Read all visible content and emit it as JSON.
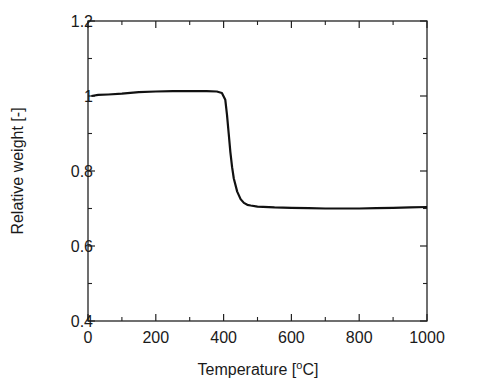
{
  "chart_data": {
    "type": "line",
    "title": "",
    "xlabel": "Temperature [oC]",
    "xlabel_parts": {
      "before": "Temperature [",
      "sup": "o",
      "after": "C]"
    },
    "ylabel": "Relative weight [-]",
    "xlim": [
      0,
      1000
    ],
    "ylim": [
      0.4,
      1.2
    ],
    "x_ticks": [
      0,
      200,
      400,
      600,
      800,
      1000
    ],
    "x_tick_labels": [
      "0",
      "200",
      "400",
      "600",
      "800",
      "1000"
    ],
    "y_ticks": [
      0.4,
      0.6,
      0.8,
      1.0,
      1.2
    ],
    "y_tick_labels": [
      "0.4",
      "0.6",
      "0.8",
      "1",
      "1.2"
    ],
    "grid": false,
    "legend": null,
    "series": [
      {
        "name": "TGA curve",
        "color": "#111111",
        "x": [
          10,
          30,
          60,
          100,
          150,
          200,
          250,
          300,
          350,
          380,
          395,
          405,
          410,
          415,
          420,
          425,
          430,
          440,
          450,
          460,
          470,
          480,
          500,
          550,
          600,
          650,
          700,
          750,
          800,
          850,
          900,
          950,
          1000
        ],
        "y": [
          1.0,
          1.003,
          1.004,
          1.006,
          1.01,
          1.012,
          1.013,
          1.013,
          1.013,
          1.012,
          1.008,
          0.99,
          0.95,
          0.9,
          0.85,
          0.81,
          0.78,
          0.745,
          0.725,
          0.715,
          0.71,
          0.708,
          0.705,
          0.703,
          0.702,
          0.701,
          0.7,
          0.7,
          0.7,
          0.701,
          0.702,
          0.703,
          0.704
        ]
      }
    ]
  }
}
